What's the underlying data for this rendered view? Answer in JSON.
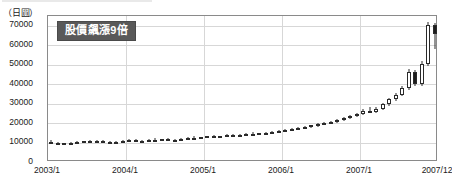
{
  "unit_label": "（日圓）",
  "annotation": {
    "text": "股價飆漲9倍"
  },
  "chart_data": {
    "type": "candlestick",
    "title": "",
    "subtitle": "",
    "xlabel": "",
    "ylabel": "（日圓）",
    "ylim": [
      0,
      75000
    ],
    "yticks": [
      0,
      10000,
      20000,
      30000,
      40000,
      50000,
      60000,
      70000
    ],
    "ytick_labels": [
      "0",
      "10000",
      "20000",
      "30000",
      "40000",
      "50000",
      "60000",
      "70000"
    ],
    "xticks": [
      "2003/1",
      "2004/1",
      "2005/1",
      "2006/1",
      "2007/1",
      "2007/12"
    ],
    "xlim": [
      "2003/1",
      "2007/12"
    ],
    "grid": true,
    "legend": null,
    "annotations": [
      {
        "text": "股價飆漲9倍",
        "x": "2003/4",
        "y": 68000
      }
    ],
    "series_name": "股價",
    "candles": [
      {
        "t": "2003/1",
        "o": 10500,
        "h": 11400,
        "l": 9600,
        "c": 9900
      },
      {
        "t": "2003/2",
        "o": 9900,
        "h": 10400,
        "l": 9300,
        "c": 9500
      },
      {
        "t": "2003/3",
        "o": 9500,
        "h": 10000,
        "l": 9000,
        "c": 9700
      },
      {
        "t": "2003/4",
        "o": 9700,
        "h": 10200,
        "l": 9200,
        "c": 9400
      },
      {
        "t": "2003/5",
        "o": 9400,
        "h": 10600,
        "l": 9100,
        "c": 10300
      },
      {
        "t": "2003/6",
        "o": 10300,
        "h": 11000,
        "l": 9900,
        "c": 10700
      },
      {
        "t": "2003/7",
        "o": 10700,
        "h": 11200,
        "l": 10100,
        "c": 10400
      },
      {
        "t": "2003/8",
        "o": 10400,
        "h": 11100,
        "l": 10000,
        "c": 10800
      },
      {
        "t": "2003/9",
        "o": 10800,
        "h": 11300,
        "l": 10200,
        "c": 10500
      },
      {
        "t": "2003/10",
        "o": 10500,
        "h": 11000,
        "l": 9900,
        "c": 10100
      },
      {
        "t": "2003/11",
        "o": 10100,
        "h": 10700,
        "l": 9600,
        "c": 10400
      },
      {
        "t": "2003/12",
        "o": 10400,
        "h": 11200,
        "l": 10000,
        "c": 10900
      },
      {
        "t": "2004/1",
        "o": 10900,
        "h": 11600,
        "l": 10400,
        "c": 11100
      },
      {
        "t": "2004/2",
        "o": 11100,
        "h": 11700,
        "l": 10600,
        "c": 10800
      },
      {
        "t": "2004/3",
        "o": 10800,
        "h": 11400,
        "l": 10300,
        "c": 11000
      },
      {
        "t": "2004/4",
        "o": 11000,
        "h": 11800,
        "l": 10500,
        "c": 11500
      },
      {
        "t": "2004/5",
        "o": 11500,
        "h": 12100,
        "l": 10900,
        "c": 11200
      },
      {
        "t": "2004/6",
        "o": 11200,
        "h": 11900,
        "l": 10700,
        "c": 11600
      },
      {
        "t": "2004/7",
        "o": 11600,
        "h": 12200,
        "l": 11000,
        "c": 11300
      },
      {
        "t": "2004/8",
        "o": 11300,
        "h": 11900,
        "l": 10800,
        "c": 11500
      },
      {
        "t": "2004/9",
        "o": 11500,
        "h": 12300,
        "l": 11000,
        "c": 12000
      },
      {
        "t": "2004/10",
        "o": 12000,
        "h": 12700,
        "l": 11500,
        "c": 12400
      },
      {
        "t": "2004/11",
        "o": 12400,
        "h": 13100,
        "l": 11900,
        "c": 12100
      },
      {
        "t": "2004/12",
        "o": 12100,
        "h": 12900,
        "l": 11700,
        "c": 12600
      },
      {
        "t": "2005/1",
        "o": 12600,
        "h": 13500,
        "l": 12100,
        "c": 13200
      },
      {
        "t": "2005/2",
        "o": 13200,
        "h": 13900,
        "l": 12700,
        "c": 12900
      },
      {
        "t": "2005/3",
        "o": 12900,
        "h": 13600,
        "l": 12400,
        "c": 13300
      },
      {
        "t": "2005/4",
        "o": 13300,
        "h": 14200,
        "l": 12800,
        "c": 13800
      },
      {
        "t": "2005/5",
        "o": 13800,
        "h": 14400,
        "l": 13200,
        "c": 13500
      },
      {
        "t": "2005/6",
        "o": 13500,
        "h": 14300,
        "l": 13000,
        "c": 14000
      },
      {
        "t": "2005/7",
        "o": 14000,
        "h": 14800,
        "l": 13500,
        "c": 14500
      },
      {
        "t": "2005/8",
        "o": 14500,
        "h": 15200,
        "l": 14000,
        "c": 14200
      },
      {
        "t": "2005/9",
        "o": 14200,
        "h": 15000,
        "l": 13700,
        "c": 14700
      },
      {
        "t": "2005/10",
        "o": 14700,
        "h": 15500,
        "l": 14200,
        "c": 15100
      },
      {
        "t": "2005/11",
        "o": 15100,
        "h": 15900,
        "l": 14600,
        "c": 15500
      },
      {
        "t": "2005/12",
        "o": 15500,
        "h": 16400,
        "l": 15000,
        "c": 16000
      },
      {
        "t": "2006/1",
        "o": 16000,
        "h": 17000,
        "l": 15400,
        "c": 16600
      },
      {
        "t": "2006/2",
        "o": 16600,
        "h": 17400,
        "l": 16000,
        "c": 17000
      },
      {
        "t": "2006/3",
        "o": 17000,
        "h": 18100,
        "l": 16500,
        "c": 17700
      },
      {
        "t": "2006/4",
        "o": 17700,
        "h": 18600,
        "l": 17100,
        "c": 18200
      },
      {
        "t": "2006/5",
        "o": 18200,
        "h": 19200,
        "l": 17600,
        "c": 18800
      },
      {
        "t": "2006/6",
        "o": 18800,
        "h": 19800,
        "l": 18200,
        "c": 19400
      },
      {
        "t": "2006/7",
        "o": 19400,
        "h": 20500,
        "l": 18800,
        "c": 20000
      },
      {
        "t": "2006/8",
        "o": 20000,
        "h": 21300,
        "l": 19400,
        "c": 20800
      },
      {
        "t": "2006/9",
        "o": 20800,
        "h": 22100,
        "l": 20200,
        "c": 21600
      },
      {
        "t": "2006/10",
        "o": 21600,
        "h": 23000,
        "l": 21000,
        "c": 22500
      },
      {
        "t": "2006/11",
        "o": 22500,
        "h": 24200,
        "l": 21900,
        "c": 23600
      },
      {
        "t": "2006/12",
        "o": 23600,
        "h": 25400,
        "l": 23000,
        "c": 24800
      },
      {
        "t": "2007/1",
        "o": 24800,
        "h": 27000,
        "l": 24200,
        "c": 26400
      },
      {
        "t": "2007/2",
        "o": 26400,
        "h": 28500,
        "l": 25600,
        "c": 25900
      },
      {
        "t": "2007/3",
        "o": 25900,
        "h": 28000,
        "l": 25200,
        "c": 27400
      },
      {
        "t": "2007/4",
        "o": 27400,
        "h": 30500,
        "l": 26800,
        "c": 29800
      },
      {
        "t": "2007/5",
        "o": 29800,
        "h": 33000,
        "l": 29000,
        "c": 32200
      },
      {
        "t": "2007/6",
        "o": 32200,
        "h": 35500,
        "l": 31400,
        "c": 34600
      },
      {
        "t": "2007/7",
        "o": 34600,
        "h": 39000,
        "l": 33800,
        "c": 38000
      },
      {
        "t": "2007/8",
        "o": 38000,
        "h": 48000,
        "l": 37200,
        "c": 46000
      },
      {
        "t": "2007/9",
        "o": 46000,
        "h": 47500,
        "l": 39000,
        "c": 40000
      },
      {
        "t": "2007/10",
        "o": 40000,
        "h": 52000,
        "l": 39000,
        "c": 50500
      },
      {
        "t": "2007/11",
        "o": 50500,
        "h": 72000,
        "l": 49500,
        "c": 70500
      },
      {
        "t": "2007/12",
        "o": 70500,
        "h": 71500,
        "l": 58000,
        "c": 65500
      }
    ]
  }
}
